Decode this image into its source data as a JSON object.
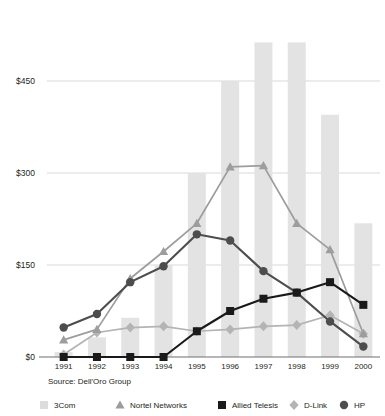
{
  "chart_data": {
    "type": "bar",
    "title": "",
    "subtitle": "",
    "xlabel": "",
    "ylabel": "",
    "categories": [
      "1991",
      "1992",
      "1993",
      "1994",
      "1995",
      "1996",
      "1997",
      "1998",
      "1999",
      "2000"
    ],
    "ylim": [
      0,
      540
    ],
    "yticks": [
      0,
      150,
      300,
      450
    ],
    "ytick_labels": [
      "$0",
      "$150",
      "$300",
      "$450"
    ],
    "grid": "horizontal",
    "legend_position": "bottom",
    "source_note": "Source: Dell'Oro Group",
    "series": [
      {
        "name": "3Com",
        "render": "bar",
        "marker": "square",
        "color": "#e3e3e3",
        "values": [
          8,
          32,
          64,
          150,
          300,
          450,
          513,
          513,
          395,
          218
        ]
      },
      {
        "name": "Nortel Networks",
        "render": "line",
        "marker": "triangle",
        "color": "#9d9d9d",
        "values": [
          28,
          45,
          128,
          172,
          218,
          310,
          312,
          218,
          175,
          38
        ]
      },
      {
        "name": "Allied Telesis",
        "render": "line",
        "marker": "square",
        "color": "#1a1a1a",
        "values": [
          0,
          0,
          0,
          0,
          42,
          75,
          95,
          105,
          122,
          85
        ]
      },
      {
        "name": "D-Link",
        "render": "line",
        "marker": "diamond",
        "color": "#b4b4b4",
        "values": [
          4,
          40,
          48,
          50,
          42,
          45,
          50,
          52,
          68,
          38
        ]
      },
      {
        "name": "HP",
        "render": "line",
        "marker": "circle",
        "color": "#4d4d4d",
        "values": [
          48,
          70,
          122,
          148,
          200,
          190,
          140,
          105,
          58,
          17
        ]
      }
    ]
  },
  "legend": {
    "items": [
      {
        "label": "3Com",
        "marker": "square",
        "color": "#dcdcdc"
      },
      {
        "label": "Nortel Networks",
        "marker": "triangle",
        "color": "#9d9d9d"
      },
      {
        "label": "Allied Telesis",
        "marker": "square",
        "color": "#1a1a1a"
      },
      {
        "label": "D-Link",
        "marker": "diamond",
        "color": "#b4b4b4"
      },
      {
        "label": "HP",
        "marker": "circle",
        "color": "#4d4d4d"
      }
    ]
  },
  "axis": {
    "y_labels": [
      "$450",
      "$300",
      "$150",
      "$0"
    ],
    "x_labels": [
      "1991",
      "1992",
      "1993",
      "1994",
      "1995",
      "1996",
      "1997",
      "1998",
      "1999",
      "2000"
    ]
  },
  "footer": {
    "source": "Source: Dell'Oro Group"
  }
}
